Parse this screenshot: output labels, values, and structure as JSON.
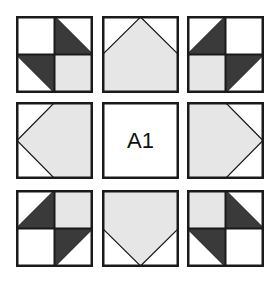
{
  "colors": {
    "background": "#ffffff",
    "outline": "#1a1a1a",
    "dark": "#3a3a3a",
    "light": "#e6e6e6",
    "white": "#ffffff"
  },
  "grid": {
    "rows": 3,
    "cols": 3,
    "tiles": [
      {
        "id": "top-left",
        "type": "quadrant-pinwheel",
        "center_label": ""
      },
      {
        "id": "top-center",
        "type": "arrow-up",
        "center_label": ""
      },
      {
        "id": "top-right",
        "type": "quadrant-pinwheel",
        "center_label": ""
      },
      {
        "id": "middle-left",
        "type": "arrow-left",
        "center_label": ""
      },
      {
        "id": "center",
        "type": "label",
        "center_label": "A1"
      },
      {
        "id": "middle-right",
        "type": "arrow-right",
        "center_label": ""
      },
      {
        "id": "bottom-left",
        "type": "quadrant-pinwheel",
        "center_label": ""
      },
      {
        "id": "bottom-center",
        "type": "arrow-down",
        "center_label": ""
      },
      {
        "id": "bottom-right",
        "type": "quadrant-pinwheel",
        "center_label": ""
      }
    ]
  },
  "center_label": "A1"
}
